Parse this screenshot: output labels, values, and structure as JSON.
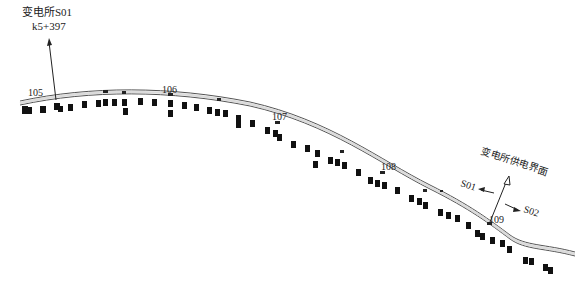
{
  "diagram": {
    "type": "railway-plan",
    "substation": {
      "name": "变电所S01",
      "chainage": "k5+397"
    },
    "boundary": {
      "label": "变电所供电界面",
      "left_section": "S01",
      "right_section": "S02"
    },
    "mileposts": [
      {
        "label": "105",
        "x": 28,
        "y": 96
      },
      {
        "label": "106",
        "x": 162,
        "y": 93
      },
      {
        "label": "107",
        "x": 272,
        "y": 120
      },
      {
        "label": "108",
        "x": 381,
        "y": 170
      },
      {
        "label": "109",
        "x": 489,
        "y": 223
      }
    ],
    "colors": {
      "line": "#444444",
      "fill": "#111111",
      "track_fill": "#d8d8d8",
      "text": "#222222"
    }
  }
}
